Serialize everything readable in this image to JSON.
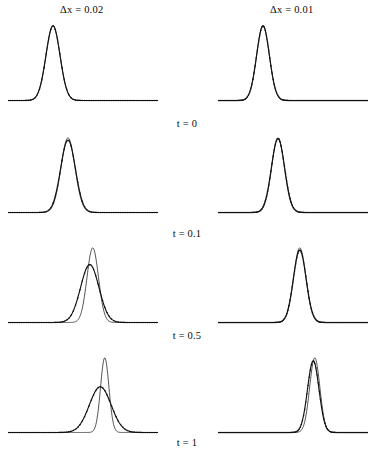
{
  "figure": {
    "type": "multi-panel-line-plot",
    "rows": 4,
    "columns": 2
  },
  "columns": [
    {
      "id": "col-dx-002",
      "label": "Δx = 0.02",
      "delta_x": 0.02
    },
    {
      "id": "col-dx-001",
      "label": "Δx = 0.01",
      "delta_x": 0.01
    }
  ],
  "rows": [
    {
      "id": "row-t-0",
      "label": "t = 0",
      "t": 0
    },
    {
      "id": "row-t-01",
      "label": "t = 0.1",
      "t": 0.1
    },
    {
      "id": "row-t-05",
      "label": "t = 0.5",
      "t": 0.5
    },
    {
      "id": "row-t-1",
      "label": "t = 1",
      "t": 1
    }
  ],
  "chart_data": {
    "type": "line",
    "title": "",
    "xlabel": "",
    "ylabel": "",
    "xlim": [
      0,
      1
    ],
    "ylim": [
      0,
      1.05
    ],
    "grid": false,
    "legend": "none",
    "series_roles": [
      {
        "name": "numerical",
        "style": "thick line with dense square markers"
      },
      {
        "name": "exact",
        "style": "thin line"
      }
    ],
    "panels": [
      {
        "panel_id": "p-dx002-t0",
        "column": "Δx = 0.02",
        "row": "t = 0",
        "series": [
          {
            "name": "numerical",
            "peak_x": 0.3,
            "peak_y": 1.0,
            "half_width": 0.055,
            "baseline_y": 0.02
          },
          {
            "name": "exact",
            "peak_x": 0.3,
            "peak_y": 1.0,
            "half_width": 0.055,
            "baseline_y": 0.02
          }
        ]
      },
      {
        "panel_id": "p-dx001-t0",
        "column": "Δx = 0.01",
        "row": "t = 0",
        "series": [
          {
            "name": "numerical",
            "peak_x": 0.3,
            "peak_y": 1.0,
            "half_width": 0.05,
            "baseline_y": 0.02
          },
          {
            "name": "exact",
            "peak_x": 0.3,
            "peak_y": 1.0,
            "half_width": 0.05,
            "baseline_y": 0.02
          }
        ]
      },
      {
        "panel_id": "p-dx002-t01",
        "column": "Δx = 0.02",
        "row": "t = 0.1",
        "series": [
          {
            "name": "numerical",
            "peak_x": 0.4,
            "peak_y": 0.97,
            "half_width": 0.058,
            "baseline_y": 0.02
          },
          {
            "name": "exact",
            "peak_x": 0.4,
            "peak_y": 1.0,
            "half_width": 0.055,
            "baseline_y": 0.02
          }
        ]
      },
      {
        "panel_id": "p-dx001-t01",
        "column": "Δx = 0.01",
        "row": "t = 0.1",
        "series": [
          {
            "name": "numerical",
            "peak_x": 0.4,
            "peak_y": 0.99,
            "half_width": 0.052,
            "baseline_y": 0.02
          },
          {
            "name": "exact",
            "peak_x": 0.4,
            "peak_y": 1.0,
            "half_width": 0.05,
            "baseline_y": 0.02
          }
        ]
      },
      {
        "panel_id": "p-dx002-t05",
        "column": "Δx = 0.02",
        "row": "t = 0.5",
        "series": [
          {
            "name": "numerical",
            "peak_x": 0.545,
            "peak_y": 0.78,
            "half_width": 0.072,
            "baseline_y": 0.02
          },
          {
            "name": "exact",
            "peak_x": 0.565,
            "peak_y": 1.0,
            "half_width": 0.045,
            "baseline_y": 0.02
          }
        ]
      },
      {
        "panel_id": "p-dx001-t05",
        "column": "Δx = 0.01",
        "row": "t = 0.5",
        "series": [
          {
            "name": "numerical",
            "peak_x": 0.545,
            "peak_y": 0.97,
            "half_width": 0.05,
            "baseline_y": 0.02
          },
          {
            "name": "exact",
            "peak_x": 0.545,
            "peak_y": 1.0,
            "half_width": 0.048,
            "baseline_y": 0.02
          }
        ]
      },
      {
        "panel_id": "p-dx002-t1",
        "column": "Δx = 0.02",
        "row": "t = 1",
        "series": [
          {
            "name": "numerical",
            "peak_x": 0.615,
            "peak_y": 0.62,
            "half_width": 0.085,
            "baseline_y": 0.02
          },
          {
            "name": "exact",
            "peak_x": 0.645,
            "peak_y": 1.0,
            "half_width": 0.033,
            "baseline_y": 0.02
          }
        ]
      },
      {
        "panel_id": "p-dx001-t1",
        "column": "Δx = 0.01",
        "row": "t = 1",
        "series": [
          {
            "name": "numerical",
            "peak_x": 0.635,
            "peak_y": 0.96,
            "half_width": 0.045,
            "baseline_y": 0.02
          },
          {
            "name": "exact",
            "peak_x": 0.645,
            "peak_y": 1.0,
            "half_width": 0.04,
            "baseline_y": 0.02
          }
        ]
      }
    ]
  },
  "colors": {
    "ink": "#111111",
    "background": "#ffffff"
  }
}
